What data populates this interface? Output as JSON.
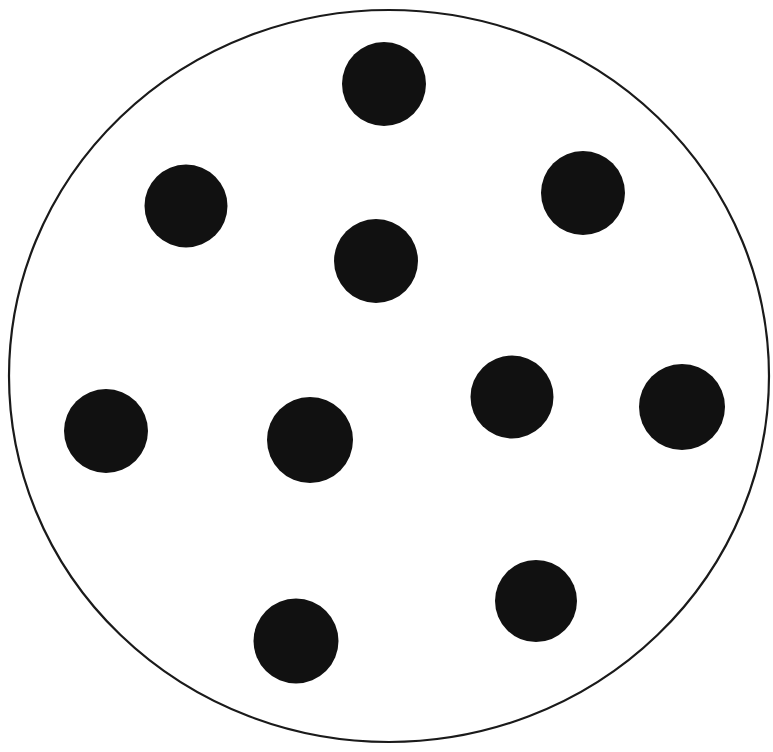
{
  "figure": {
    "kind": "circular-dish-with-dots-diagram",
    "canvas": {
      "width": 773,
      "height": 752
    },
    "background_color": "#FFFFFF",
    "title": "",
    "caption": "",
    "dot_count_label": "10"
  },
  "dish": {
    "name": "outer-circle",
    "shape": "ellipse",
    "cx": 389,
    "cy": 376,
    "rx": 380,
    "ry": 366,
    "fill_color": "#FFFFFF",
    "stroke_color": "#1A1A1A",
    "stroke_width": 2.2
  },
  "dots": {
    "fill_color": "#111111",
    "count": 10,
    "items": [
      {
        "id": "dot-top-center",
        "label": "1",
        "cx": 384,
        "cy": 84,
        "r": 42.0
      },
      {
        "id": "dot-upper-left",
        "label": "2",
        "cx": 186,
        "cy": 206,
        "r": 41.5
      },
      {
        "id": "dot-upper-right",
        "label": "3",
        "cx": 583,
        "cy": 193,
        "r": 42.0
      },
      {
        "id": "dot-center-upper",
        "label": "4",
        "cx": 376,
        "cy": 261,
        "r": 42.0
      },
      {
        "id": "dot-left-middle",
        "label": "5",
        "cx": 106,
        "cy": 431,
        "r": 42.0
      },
      {
        "id": "dot-center-middle",
        "label": "6",
        "cx": 310,
        "cy": 440,
        "r": 43.0
      },
      {
        "id": "dot-right-middle",
        "label": "7",
        "cx": 512,
        "cy": 397,
        "r": 41.5
      },
      {
        "id": "dot-far-right",
        "label": "8",
        "cx": 682,
        "cy": 407,
        "r": 43.0
      },
      {
        "id": "dot-bottom-right",
        "label": "9",
        "cx": 536,
        "cy": 601,
        "r": 41.0
      },
      {
        "id": "dot-bottom-left",
        "label": "10",
        "cx": 296,
        "cy": 641,
        "r": 42.5
      }
    ]
  },
  "chart_data": {
    "type": "scatter",
    "title": "",
    "xlabel": "",
    "ylabel": "",
    "xlim": [
      0,
      773
    ],
    "ylim": [
      752,
      0
    ],
    "grid": false,
    "legend": "none",
    "annotations": [
      "Large thin-stroked circle (dish boundary) enclosing all markers"
    ],
    "series": [
      {
        "name": "colonies",
        "marker": "filled-circle",
        "color": "#111111",
        "marker_radius_px": 42,
        "n": 10,
        "x": [
          384,
          186,
          583,
          376,
          106,
          310,
          512,
          682,
          536,
          296
        ],
        "y": [
          84,
          206,
          193,
          261,
          431,
          440,
          397,
          407,
          601,
          641
        ]
      }
    ],
    "boundary": {
      "name": "dish-outline",
      "type": "ellipse",
      "cx": 389,
      "cy": 376,
      "rx": 380,
      "ry": 366,
      "stroke": "#1A1A1A"
    }
  }
}
